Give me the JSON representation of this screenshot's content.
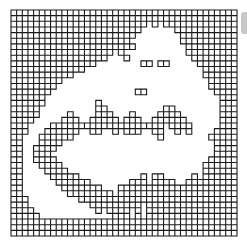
{
  "figure": {
    "type": "lattice-cluster-diagram",
    "grid": {
      "cols": 40,
      "rows": 40,
      "origin_x": 11,
      "origin_y": 10,
      "cell_size": 5.65,
      "line_color": "#1a1a1a",
      "line_width": 1.1,
      "background": "#ffffff"
    },
    "mask_legend": {
      "#": "occupied cell (edges drawn)",
      ".": "empty cell"
    },
    "mask": [
      "########################################",
      "########################################",
      "########################.#.##.##########",
      "#######################......#.#########",
      "######################........##########",
      "#####################.........##########",
      "###################.##.........#########",
      "##################.#...........#########",
      "#################...#...........########",
      "###############........##.##.....#######",
      "#############.....................######",
      "###########.......................######",
      "#########..........................#####",
      "########...........................#####",
      "#######...............##............####",
      "######...............................###",
      "######.........#.....................###",
      "#####..........##..........##........###",
      "#####.....#....###...#....####.......###",
      "####.....###..#####.###..######......###",
      "###....####################.####.....###",
      "###...######..##..#.###..##..#.#....####",
      "##...######...............#........#####",
      "##...####...........................####",
      "##..####............................####",
      "##..###.............................####",
      "##..####...........................#####",
      "##...####.........................######",
      "##....####........................######",
      "##.....#####...........#.##.....#.######",
      "##......######.......###.####..#########",
      "##.......#######...######################",
      "##........########.#.###################",
      "###.........#######.##.#################",
      "###...........#########.################",
      "####...........#.#.##.#.################",
      "#####.............#.#.#.################",
      "########################################",
      "########################################",
      "########################################"
    ],
    "edge_fragment_color": "#c8c8c8"
  }
}
